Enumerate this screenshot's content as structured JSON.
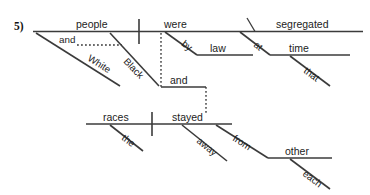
{
  "exercise": {
    "number_label": "5)"
  },
  "colors": {
    "line": "#3b3b3b",
    "text": "#1c1c1c",
    "background": "#ffffff"
  },
  "diagram": {
    "type": "reed-kellogg-sentence-diagram",
    "clauses": [
      {
        "id": "clause-1",
        "subject": "people",
        "verb": "were",
        "complement": "segregated",
        "modifiers": [
          {
            "word": "and",
            "role": "conjunction",
            "attaches_to": "people"
          },
          {
            "word": "White",
            "role": "adjective",
            "attaches_to": "people"
          },
          {
            "word": "Black",
            "role": "adjective",
            "attaches_to": "people"
          },
          {
            "word": "by",
            "role": "preposition",
            "attaches_to": "segregated"
          },
          {
            "word": "law",
            "role": "object-of-preposition",
            "attaches_to": "by"
          },
          {
            "word": "at",
            "role": "preposition",
            "attaches_to": "segregated"
          },
          {
            "word": "time",
            "role": "object-of-preposition",
            "attaches_to": "at"
          },
          {
            "word": "that",
            "role": "adjective",
            "attaches_to": "time"
          }
        ]
      },
      {
        "id": "clause-2",
        "subject": "races",
        "verb": "stayed",
        "complement": "",
        "modifiers": [
          {
            "word": "the",
            "role": "article",
            "attaches_to": "races"
          },
          {
            "word": "away",
            "role": "adverb",
            "attaches_to": "stayed"
          },
          {
            "word": "from",
            "role": "preposition",
            "attaches_to": "stayed"
          },
          {
            "word": "other",
            "role": "object-of-preposition",
            "attaches_to": "from"
          },
          {
            "word": "each",
            "role": "adjective",
            "attaches_to": "other"
          }
        ]
      }
    ],
    "coordinating_conjunction": {
      "word": "and",
      "joins": [
        "clause-1",
        "clause-2"
      ]
    },
    "words": {
      "people": "people",
      "were": "were",
      "segregated": "segregated",
      "and_subject": "and",
      "white": "White",
      "black": "Black",
      "by": "by",
      "law": "law",
      "at": "at",
      "time": "time",
      "that": "that",
      "and_clause": "and",
      "races": "races",
      "stayed": "stayed",
      "the": "the",
      "away": "away",
      "from": "from",
      "other": "other",
      "each": "each"
    }
  }
}
